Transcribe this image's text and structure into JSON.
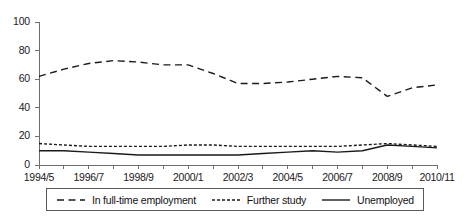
{
  "chart_data": {
    "type": "line",
    "title": "",
    "xlabel": "",
    "ylabel": "",
    "ylim": [
      0,
      100
    ],
    "yticks": [
      0,
      20,
      40,
      60,
      80,
      100
    ],
    "grid": false,
    "legend_position": "bottom",
    "x": [
      "1994/5",
      "1995/6",
      "1996/7",
      "1997/8",
      "1998/9",
      "1999/0",
      "2000/1",
      "2001/2",
      "2002/3",
      "2003/4",
      "2004/5",
      "2005/6",
      "2006/7",
      "2007/8",
      "2008/9",
      "2009/10",
      "2010/11"
    ],
    "xtick_labels": [
      "1994/5",
      "1996/7",
      "1998/9",
      "2000/1",
      "2002/3",
      "2004/5",
      "2006/7",
      "2008/9",
      "2010/11"
    ],
    "xtick_label_indices": [
      0,
      2,
      4,
      6,
      8,
      10,
      12,
      14,
      16
    ],
    "series": [
      {
        "name": "In full-time employment",
        "style": "long-dash",
        "color": "#1a1a1a",
        "values": [
          62,
          67,
          71,
          73,
          72,
          70,
          70,
          64,
          57,
          57,
          58,
          60,
          62,
          61,
          48,
          54,
          56
        ]
      },
      {
        "name": "Further study",
        "style": "short-dash",
        "color": "#1a1a1a",
        "values": [
          15,
          14,
          13,
          13,
          13,
          13,
          14,
          14,
          13,
          13,
          13,
          13,
          13,
          14,
          15,
          14,
          13
        ]
      },
      {
        "name": "Unemployed",
        "style": "solid",
        "color": "#1a1a1a",
        "values": [
          10,
          10,
          9,
          8,
          7,
          7,
          7,
          7,
          7,
          8,
          9,
          10,
          9,
          10,
          14,
          13,
          12
        ]
      }
    ]
  },
  "legend": {
    "items": [
      {
        "label": "In full-time employment",
        "style": "long-dash"
      },
      {
        "label": "Further study",
        "style": "short-dash"
      },
      {
        "label": "Unemployed",
        "style": "solid"
      }
    ]
  }
}
